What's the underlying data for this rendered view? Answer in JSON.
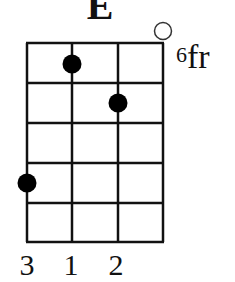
{
  "chord": {
    "name": "E",
    "fret_position_number": "6",
    "fret_position_suffix": "fr",
    "strings": 4,
    "frets_shown": 5,
    "open_strings": [
      4
    ],
    "dots": [
      {
        "string": 2,
        "fret": 1
      },
      {
        "string": 3,
        "fret": 2
      },
      {
        "string": 1,
        "fret": 4
      }
    ],
    "finger_numbers": [
      "3",
      "1",
      "2"
    ],
    "colors": {
      "line": "#111111",
      "dot": "#000000",
      "background": "#ffffff"
    }
  }
}
